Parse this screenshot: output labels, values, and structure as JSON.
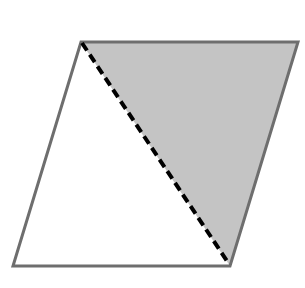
{
  "diagram": {
    "shape": "parallelogram",
    "vertices": {
      "top_left": [
        81,
        42
      ],
      "top_right": [
        298,
        42
      ],
      "bottom_right": [
        230,
        266
      ],
      "bottom_left": [
        13,
        266
      ]
    },
    "diagonal": {
      "from": "top_left",
      "to": "bottom_right",
      "style": "dashed"
    },
    "shaded_region": [
      "top_left",
      "top_right",
      "bottom_right"
    ],
    "colors": {
      "background": "#ffffff",
      "outline": "#6e6e6e",
      "shade": "#c4c4c4",
      "diagonal": "#000000"
    }
  }
}
